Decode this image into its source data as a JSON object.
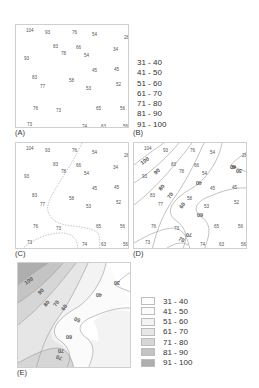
{
  "figure": {
    "panels": {
      "A": {
        "label": "(A)",
        "description": "Sample point values"
      },
      "B": {
        "label": "(B)",
        "description": "Class intervals"
      },
      "C": {
        "label": "(C)",
        "description": "Sample points with dashed boundaries"
      },
      "D": {
        "label": "(D)",
        "description": "Isoline map with labeled contours"
      },
      "E": {
        "label": "(E)",
        "description": "Shaded isopleth map"
      }
    },
    "points": [
      {
        "v": "104",
        "x": 10,
        "y": 3
      },
      {
        "v": "93",
        "x": 29,
        "y": 5
      },
      {
        "v": "76",
        "x": 56,
        "y": 5
      },
      {
        "v": "54",
        "x": 76,
        "y": 7
      },
      {
        "v": "28",
        "x": 108,
        "y": 10
      },
      {
        "v": "83",
        "x": 37,
        "y": 19
      },
      {
        "v": "66",
        "x": 60,
        "y": 20
      },
      {
        "v": "34",
        "x": 97,
        "y": 22
      },
      {
        "v": "78",
        "x": 45,
        "y": 26
      },
      {
        "v": "54",
        "x": 68,
        "y": 28
      },
      {
        "v": "93",
        "x": 8,
        "y": 31
      },
      {
        "v": "45",
        "x": 76,
        "y": 43
      },
      {
        "v": "45",
        "x": 98,
        "y": 42
      },
      {
        "v": "83",
        "x": 16,
        "y": 50
      },
      {
        "v": "58",
        "x": 53,
        "y": 53
      },
      {
        "v": "52",
        "x": 100,
        "y": 57
      },
      {
        "v": "77",
        "x": 24,
        "y": 59
      },
      {
        "v": "53",
        "x": 70,
        "y": 61
      },
      {
        "v": "76",
        "x": 17,
        "y": 81
      },
      {
        "v": "73",
        "x": 40,
        "y": 83
      },
      {
        "v": "65",
        "x": 80,
        "y": 81
      },
      {
        "v": "56",
        "x": 104,
        "y": 81
      },
      {
        "v": "73",
        "x": 11,
        "y": 97
      },
      {
        "v": "74",
        "x": 66,
        "y": 99
      },
      {
        "v": "63",
        "x": 85,
        "y": 99
      },
      {
        "v": "56",
        "x": 107,
        "y": 99
      }
    ],
    "classes": [
      "31 - 40",
      "41 - 50",
      "51 - 60",
      "61 - 70",
      "71 - 80",
      "81 - 90",
      "91 - 100"
    ],
    "class_colors": [
      "#ffffff",
      "#fbfbfb",
      "#f3f3f3",
      "#e6e6e6",
      "#d6d6d6",
      "#c4c4c4",
      "#aeaeae"
    ],
    "contour_labels_D": [
      "100",
      "90",
      "80",
      "70",
      "60",
      "40",
      "30",
      "60",
      "70",
      "70"
    ],
    "contour_labels_E": [
      "100",
      "90",
      "80",
      "70",
      "60",
      "30",
      "40",
      "50",
      "60",
      "70",
      "70"
    ]
  }
}
